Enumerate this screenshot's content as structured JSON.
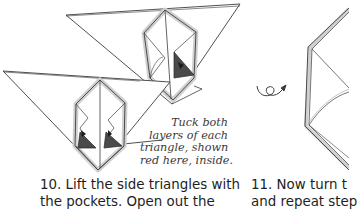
{
  "diagram": {
    "type": "origami-instructions",
    "colors": {
      "line": "#3c3c3c",
      "shadow": "#cfcfcf",
      "tuck_triangle": "#4a4a4a",
      "tuck_triangle_dark": "#262626",
      "text_note": "#3a3a3a",
      "text_caption": "#1e1e1e"
    },
    "note": {
      "lines": [
        "Tuck both",
        "layers of each",
        "triangle, shown",
        "red here, inside."
      ]
    },
    "steps": [
      {
        "number": "10.",
        "lines": [
          "10. Lift the side triangles with",
          "the pockets. Open out the"
        ]
      },
      {
        "number": "11.",
        "lines": [
          "11. Now turn t",
          "and repeat step"
        ]
      }
    ],
    "icons": {
      "turn_over": "turn-over-loop-arrow"
    }
  }
}
